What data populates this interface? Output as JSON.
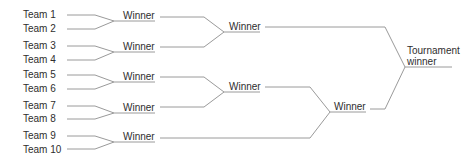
{
  "diagram": {
    "type": "tournament-bracket",
    "line_color": "#9a9a9a",
    "text_color": "#2e2e2e",
    "teams": [
      {
        "label": "Team 1",
        "x": 23,
        "y": 9
      },
      {
        "label": "Team 2",
        "x": 23,
        "y": 23
      },
      {
        "label": "Team 3",
        "x": 23,
        "y": 40
      },
      {
        "label": "Team 4",
        "x": 23,
        "y": 54
      },
      {
        "label": "Team 5",
        "x": 23,
        "y": 69
      },
      {
        "label": "Team 6",
        "x": 23,
        "y": 83
      },
      {
        "label": "Team 7",
        "x": 23,
        "y": 100
      },
      {
        "label": "Team 8",
        "x": 23,
        "y": 113
      },
      {
        "label": "Team 9",
        "x": 23,
        "y": 130
      },
      {
        "label": "Team 10",
        "x": 23,
        "y": 144
      }
    ],
    "round1_winners": [
      {
        "label": "Winner",
        "x": 123,
        "y": 10
      },
      {
        "label": "Winner",
        "x": 123,
        "y": 41
      },
      {
        "label": "Winner",
        "x": 123,
        "y": 71
      },
      {
        "label": "Winner",
        "x": 123,
        "y": 102
      },
      {
        "label": "Winner",
        "x": 123,
        "y": 131
      }
    ],
    "round2_winners": [
      {
        "label": "Winner",
        "x": 229,
        "y": 21
      },
      {
        "label": "Winner",
        "x": 229,
        "y": 81
      }
    ],
    "round3_winners": [
      {
        "label": "Winner",
        "x": 334,
        "y": 101
      }
    ],
    "final": {
      "line1": "Tournament",
      "line2": "winner",
      "x": 407,
      "y": 45
    },
    "paths": [
      "M67,15 L95,15 L114,21 L155,21",
      "M67,29 L95,29 L114,21",
      "M67,46 L95,46 L114,52 L155,52",
      "M67,60 L95,60 L114,52",
      "M67,75 L95,75 L114,82 L155,82",
      "M67,89 L95,89 L114,82",
      "M67,106 L95,106 L114,113 L155,113",
      "M67,119 L95,119 L114,113",
      "M67,136 L95,136 L114,142 L155,142",
      "M67,149 L95,149 L114,142",
      "M160,17 L204,17 L224,32 L260,32",
      "M160,47 L204,47 L224,32",
      "M160,77 L204,77 L224,92 L260,92",
      "M160,107 L204,107 L224,92",
      "M265,87 L310,87 L330,112 L366,112",
      "M160,138 L310,138 L330,112",
      "M265,27 L385,27 L405,67 L452,67",
      "M370,109 L385,109 L405,67"
    ]
  }
}
